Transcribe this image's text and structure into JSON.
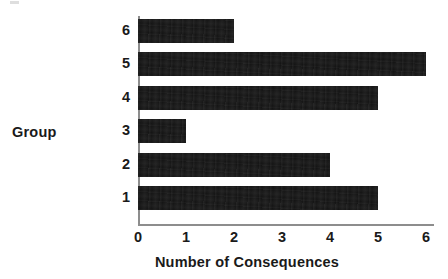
{
  "chart_data": {
    "type": "bar",
    "orientation": "horizontal",
    "title": "",
    "xlabel": "Number of Consequences",
    "ylabel": "Group",
    "categories": [
      "1",
      "2",
      "3",
      "4",
      "5",
      "6"
    ],
    "values": [
      5,
      4,
      1,
      5,
      6,
      2
    ],
    "series": [
      {
        "name": "Number of Consequences",
        "values": [
          5,
          4,
          1,
          5,
          6,
          2
        ]
      }
    ],
    "points": [
      {
        "category": "6",
        "value": 2
      },
      {
        "category": "5",
        "value": 6
      },
      {
        "category": "4",
        "value": 5
      },
      {
        "category": "3",
        "value": 1
      },
      {
        "category": "2",
        "value": 4
      },
      {
        "category": "1",
        "value": 5
      }
    ],
    "xlim": [
      0,
      6
    ],
    "xticks": [
      "0",
      "1",
      "2",
      "3",
      "4",
      "5",
      "6"
    ],
    "xtick_values": [
      0,
      1,
      2,
      3,
      4,
      5,
      6
    ],
    "yticks": [
      "6",
      "5",
      "4",
      "3",
      "2",
      "1"
    ],
    "grid": false,
    "legend": false,
    "legend_position": "none",
    "bar_color": "#151515",
    "axis_color": "#8d8d8d",
    "text_color": "#1a1a1a",
    "background_color": "#ffffff",
    "category_order_top_to_bottom": [
      "6",
      "5",
      "4",
      "3",
      "2",
      "1"
    ]
  },
  "axes": {
    "x_title": "Number of Consequences",
    "y_title": "Group"
  },
  "x_tick_labels": [
    "0",
    "1",
    "2",
    "3",
    "4",
    "5",
    "6"
  ],
  "y_tick_labels": [
    "6",
    "5",
    "4",
    "3",
    "2",
    "1"
  ]
}
